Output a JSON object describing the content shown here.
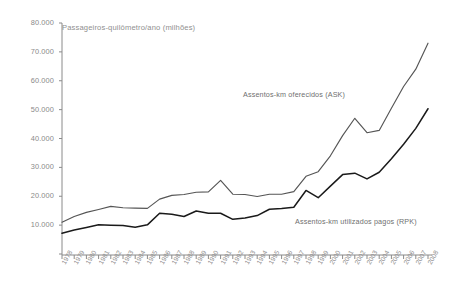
{
  "chart_data": {
    "type": "line",
    "title": "Passageiros-quilômetro/ano (milhões)",
    "xlabel": "",
    "ylabel": "",
    "ylim": [
      0,
      80000
    ],
    "ytick_labels": [
      "80.000",
      "70.000",
      "60.000",
      "50.000",
      "40.000",
      "30.000",
      "20.000",
      "10.000"
    ],
    "ytick_values": [
      80000,
      70000,
      60000,
      50000,
      40000,
      30000,
      20000,
      10000
    ],
    "grid": false,
    "legend_position": "inline-annotations",
    "categories": [
      "1978",
      "1979",
      "1980",
      "1981",
      "1982",
      "1983",
      "1984",
      "1985",
      "1986",
      "1987",
      "1988",
      "1989",
      "1990",
      "1991",
      "1992",
      "1993",
      "1994",
      "1995",
      "1996",
      "1997",
      "1998",
      "1999",
      "2000",
      "2001",
      "2002",
      "2003",
      "2004",
      "2005",
      "2006",
      "2007",
      "2008"
    ],
    "series": [
      {
        "name": "Assentos-km oferecidos (ASK)",
        "color": "#555555",
        "values": [
          11000,
          13000,
          14400,
          15400,
          16500,
          16000,
          15900,
          15800,
          19000,
          20300,
          20600,
          21400,
          21500,
          25500,
          20700,
          20600,
          19900,
          20700,
          20700,
          21600,
          26900,
          28500,
          34000,
          41000,
          47000,
          42000,
          42800,
          50500,
          58000,
          64000,
          73000
        ]
      },
      {
        "name": "Assentos-km utilizados pagos (RPK)",
        "color": "#1a1a1a",
        "values": [
          7200,
          8300,
          9200,
          10100,
          10000,
          9900,
          9300,
          10100,
          14100,
          13800,
          13000,
          14900,
          14100,
          14100,
          12000,
          12500,
          13300,
          15500,
          15800,
          16200,
          22000,
          19500,
          23500,
          27500,
          28000,
          26000,
          28300,
          33000,
          38000,
          43500,
          50300
        ]
      }
    ],
    "annotations": [
      {
        "text": "Assentos-km oferecidos (ASK)",
        "series": "ASK"
      },
      {
        "text": "Assentos-km utilizados pagos (RPK)",
        "series": "RPK"
      }
    ]
  }
}
